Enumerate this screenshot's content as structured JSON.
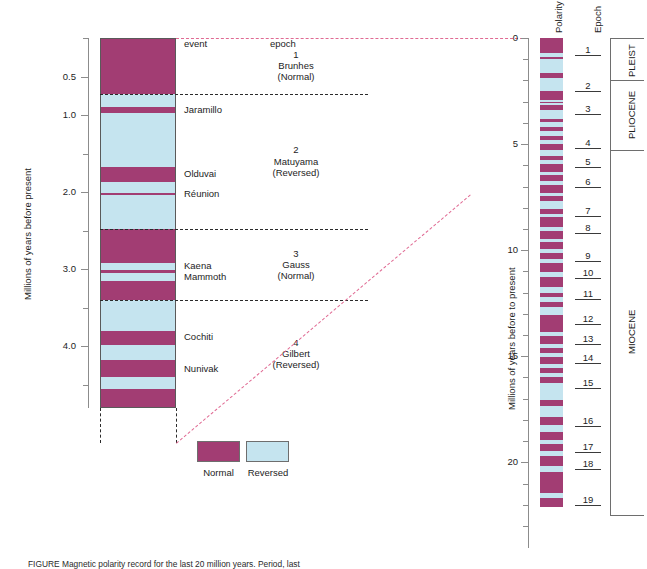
{
  "figure": {
    "caption": "FIGURE   Magnetic polarity record for the last 20 million years. Period, last",
    "left_axis_label": "Millions of years before present",
    "right_axis_label": "Millions of years before to present",
    "column_headers": {
      "event": "event",
      "epoch": "epoch",
      "polarity": "Polarity",
      "epoch_right": "Epoch"
    }
  },
  "colors": {
    "normal": "#a23d73",
    "reversed": "#c5e4ef",
    "correlation": "#e06a93",
    "axis": "#8c8c8c",
    "border": "#5a5a5a",
    "text": "#1d1d1d"
  },
  "legend": {
    "items": [
      {
        "label": "Normal",
        "color": "#a23d73"
      },
      {
        "label": "Reversed",
        "color": "#c5e4ef"
      }
    ]
  },
  "left_axis": {
    "min": 0.0,
    "max": 4.8,
    "major_ticks": [
      0.5,
      1.0,
      2.0,
      3.0,
      4.0
    ],
    "major_tick_labels": [
      "0.5",
      "1.0",
      "2.0",
      "3.0",
      "4.0"
    ],
    "minor_ticks": [
      0.0,
      1.5,
      2.5,
      3.5,
      4.5
    ],
    "unit": "Ma"
  },
  "right_axis": {
    "min": 0,
    "max": 23,
    "major_ticks": [
      0,
      5,
      10,
      15,
      20
    ],
    "major_tick_labels": [
      "0",
      "5",
      "10",
      "15",
      "20"
    ],
    "minor_tick_interval": 1,
    "unit": "Ma"
  },
  "chart_data": {
    "type": "bar",
    "title": "Magnetic polarity record for the last 20 million years",
    "xlabel": "",
    "ylabel": "Millions of years before present",
    "ylim": [
      0,
      4.8
    ],
    "categories": [
      "Normal",
      "Reversed"
    ],
    "values": [
      1,
      0
    ],
    "detail_column": {
      "name": "detailed-polarity-0-4.8Ma",
      "axis_range": [
        0.0,
        4.8
      ],
      "bands": [
        {
          "from": 0.0,
          "to": 0.72,
          "polarity": "Normal"
        },
        {
          "from": 0.72,
          "to": 0.9,
          "polarity": "Reversed"
        },
        {
          "from": 0.9,
          "to": 0.97,
          "polarity": "Normal"
        },
        {
          "from": 0.97,
          "to": 1.67,
          "polarity": "Reversed"
        },
        {
          "from": 1.67,
          "to": 1.87,
          "polarity": "Normal"
        },
        {
          "from": 1.87,
          "to": 2.01,
          "polarity": "Reversed"
        },
        {
          "from": 2.01,
          "to": 2.04,
          "polarity": "Normal"
        },
        {
          "from": 2.04,
          "to": 2.48,
          "polarity": "Reversed"
        },
        {
          "from": 2.48,
          "to": 2.92,
          "polarity": "Normal"
        },
        {
          "from": 2.92,
          "to": 3.01,
          "polarity": "Reversed"
        },
        {
          "from": 3.01,
          "to": 3.05,
          "polarity": "Normal"
        },
        {
          "from": 3.05,
          "to": 3.15,
          "polarity": "Reversed"
        },
        {
          "from": 3.15,
          "to": 3.4,
          "polarity": "Normal"
        },
        {
          "from": 3.4,
          "to": 3.8,
          "polarity": "Reversed"
        },
        {
          "from": 3.8,
          "to": 3.98,
          "polarity": "Normal"
        },
        {
          "from": 3.98,
          "to": 4.18,
          "polarity": "Reversed"
        },
        {
          "from": 4.18,
          "to": 4.4,
          "polarity": "Normal"
        },
        {
          "from": 4.4,
          "to": 4.55,
          "polarity": "Reversed"
        },
        {
          "from": 4.55,
          "to": 4.8,
          "polarity": "Normal"
        }
      ]
    },
    "summary_column": {
      "name": "polarity-0-23Ma",
      "axis_range": [
        0,
        23
      ],
      "bands": [
        {
          "from": 0.0,
          "to": 0.72,
          "polarity": "Normal"
        },
        {
          "from": 0.72,
          "to": 0.9,
          "polarity": "Reversed"
        },
        {
          "from": 0.9,
          "to": 0.97,
          "polarity": "Normal"
        },
        {
          "from": 0.97,
          "to": 1.67,
          "polarity": "Reversed"
        },
        {
          "from": 1.67,
          "to": 1.87,
          "polarity": "Normal"
        },
        {
          "from": 1.87,
          "to": 2.01,
          "polarity": "Reversed"
        },
        {
          "from": 2.01,
          "to": 2.04,
          "polarity": "Normal"
        },
        {
          "from": 2.04,
          "to": 2.48,
          "polarity": "Reversed"
        },
        {
          "from": 2.48,
          "to": 2.92,
          "polarity": "Normal"
        },
        {
          "from": 2.92,
          "to": 3.01,
          "polarity": "Reversed"
        },
        {
          "from": 3.01,
          "to": 3.05,
          "polarity": "Normal"
        },
        {
          "from": 3.05,
          "to": 3.15,
          "polarity": "Reversed"
        },
        {
          "from": 3.15,
          "to": 3.4,
          "polarity": "Normal"
        },
        {
          "from": 3.4,
          "to": 3.8,
          "polarity": "Reversed"
        },
        {
          "from": 3.8,
          "to": 3.98,
          "polarity": "Normal"
        },
        {
          "from": 3.98,
          "to": 4.18,
          "polarity": "Reversed"
        },
        {
          "from": 4.18,
          "to": 4.4,
          "polarity": "Normal"
        },
        {
          "from": 4.4,
          "to": 4.6,
          "polarity": "Reversed"
        },
        {
          "from": 4.6,
          "to": 4.8,
          "polarity": "Normal"
        },
        {
          "from": 4.8,
          "to": 5.0,
          "polarity": "Reversed"
        },
        {
          "from": 5.0,
          "to": 5.3,
          "polarity": "Normal"
        },
        {
          "from": 5.3,
          "to": 5.55,
          "polarity": "Reversed"
        },
        {
          "from": 5.55,
          "to": 5.75,
          "polarity": "Normal"
        },
        {
          "from": 5.75,
          "to": 5.95,
          "polarity": "Reversed"
        },
        {
          "from": 5.95,
          "to": 6.3,
          "polarity": "Normal"
        },
        {
          "from": 6.3,
          "to": 6.45,
          "polarity": "Reversed"
        },
        {
          "from": 6.45,
          "to": 6.75,
          "polarity": "Normal"
        },
        {
          "from": 6.75,
          "to": 6.95,
          "polarity": "Reversed"
        },
        {
          "from": 6.95,
          "to": 7.3,
          "polarity": "Normal"
        },
        {
          "from": 7.3,
          "to": 7.45,
          "polarity": "Reversed"
        },
        {
          "from": 7.45,
          "to": 7.7,
          "polarity": "Normal"
        },
        {
          "from": 7.7,
          "to": 8.05,
          "polarity": "Reversed"
        },
        {
          "from": 8.05,
          "to": 8.3,
          "polarity": "Normal"
        },
        {
          "from": 8.3,
          "to": 8.45,
          "polarity": "Reversed"
        },
        {
          "from": 8.45,
          "to": 8.9,
          "polarity": "Normal"
        },
        {
          "from": 8.9,
          "to": 9.1,
          "polarity": "Reversed"
        },
        {
          "from": 9.1,
          "to": 9.45,
          "polarity": "Normal"
        },
        {
          "from": 9.45,
          "to": 9.6,
          "polarity": "Reversed"
        },
        {
          "from": 9.6,
          "to": 9.95,
          "polarity": "Normal"
        },
        {
          "from": 9.95,
          "to": 10.15,
          "polarity": "Reversed"
        },
        {
          "from": 10.15,
          "to": 10.4,
          "polarity": "Normal"
        },
        {
          "from": 10.4,
          "to": 10.6,
          "polarity": "Reversed"
        },
        {
          "from": 10.6,
          "to": 11.05,
          "polarity": "Normal"
        },
        {
          "from": 11.05,
          "to": 11.25,
          "polarity": "Reversed"
        },
        {
          "from": 11.25,
          "to": 11.75,
          "polarity": "Normal"
        },
        {
          "from": 11.75,
          "to": 12.0,
          "polarity": "Reversed"
        },
        {
          "from": 12.0,
          "to": 12.2,
          "polarity": "Normal"
        },
        {
          "from": 12.2,
          "to": 12.45,
          "polarity": "Reversed"
        },
        {
          "from": 12.45,
          "to": 12.7,
          "polarity": "Normal"
        },
        {
          "from": 12.7,
          "to": 13.05,
          "polarity": "Reversed"
        },
        {
          "from": 13.05,
          "to": 13.85,
          "polarity": "Normal"
        },
        {
          "from": 13.85,
          "to": 14.05,
          "polarity": "Reversed"
        },
        {
          "from": 14.05,
          "to": 14.4,
          "polarity": "Normal"
        },
        {
          "from": 14.4,
          "to": 14.6,
          "polarity": "Reversed"
        },
        {
          "from": 14.6,
          "to": 14.85,
          "polarity": "Normal"
        },
        {
          "from": 14.85,
          "to": 15.05,
          "polarity": "Reversed"
        },
        {
          "from": 15.05,
          "to": 15.35,
          "polarity": "Normal"
        },
        {
          "from": 15.35,
          "to": 15.55,
          "polarity": "Reversed"
        },
        {
          "from": 15.55,
          "to": 15.8,
          "polarity": "Normal"
        },
        {
          "from": 15.8,
          "to": 16.0,
          "polarity": "Reversed"
        },
        {
          "from": 16.0,
          "to": 16.25,
          "polarity": "Normal"
        },
        {
          "from": 16.25,
          "to": 17.05,
          "polarity": "Reversed"
        },
        {
          "from": 17.05,
          "to": 17.35,
          "polarity": "Normal"
        },
        {
          "from": 17.35,
          "to": 17.85,
          "polarity": "Reversed"
        },
        {
          "from": 17.85,
          "to": 18.25,
          "polarity": "Normal"
        },
        {
          "from": 18.25,
          "to": 18.55,
          "polarity": "Reversed"
        },
        {
          "from": 18.55,
          "to": 18.95,
          "polarity": "Normal"
        },
        {
          "from": 18.95,
          "to": 19.15,
          "polarity": "Reversed"
        },
        {
          "from": 19.15,
          "to": 19.45,
          "polarity": "Normal"
        },
        {
          "from": 19.45,
          "to": 19.7,
          "polarity": "Reversed"
        },
        {
          "from": 19.7,
          "to": 20.15,
          "polarity": "Normal"
        },
        {
          "from": 20.15,
          "to": 20.45,
          "polarity": "Reversed"
        },
        {
          "from": 20.45,
          "to": 21.45,
          "polarity": "Normal"
        },
        {
          "from": 21.45,
          "to": 21.7,
          "polarity": "Reversed"
        },
        {
          "from": 21.7,
          "to": 22.1,
          "polarity": "Normal"
        }
      ]
    }
  },
  "events": [
    {
      "name": "Jaramillo",
      "age": 0.93
    },
    {
      "name": "Olduvai",
      "age": 1.77
    },
    {
      "name": "Réunion",
      "age": 2.03
    },
    {
      "name": "Kaena",
      "age": 2.96
    },
    {
      "name": "Mammoth",
      "age": 3.1
    },
    {
      "name": "Cochiti",
      "age": 3.88
    },
    {
      "name": "Nunivak",
      "age": 4.29
    }
  ],
  "magnetic_epochs": [
    {
      "number": "1",
      "name": "Brunhes",
      "polarity": "(Normal)",
      "from": 0.0,
      "to": 0.72
    },
    {
      "number": "2",
      "name": "Matuyama",
      "polarity": "(Reversed)",
      "from": 0.72,
      "to": 2.48
    },
    {
      "number": "3",
      "name": "Gauss",
      "polarity": "(Normal)",
      "from": 2.48,
      "to": 3.4
    },
    {
      "number": "4",
      "name": "Gilbert",
      "polarity": "(Reversed)",
      "from": 3.4,
      "to": 4.8
    }
  ],
  "anomaly_numbers": [
    {
      "label": "1",
      "age": 0.8
    },
    {
      "label": "2",
      "age": 2.5
    },
    {
      "label": "3",
      "age": 3.6
    },
    {
      "label": "4",
      "age": 5.2
    },
    {
      "label": "5",
      "age": 6.1
    },
    {
      "label": "6",
      "age": 7.0
    },
    {
      "label": "7",
      "age": 8.4
    },
    {
      "label": "8",
      "age": 9.2
    },
    {
      "label": "9",
      "age": 10.5
    },
    {
      "label": "10",
      "age": 11.3
    },
    {
      "label": "11",
      "age": 12.3
    },
    {
      "label": "12",
      "age": 13.5
    },
    {
      "label": "13",
      "age": 14.4
    },
    {
      "label": "14",
      "age": 15.3
    },
    {
      "label": "15",
      "age": 16.5
    },
    {
      "label": "16",
      "age": 18.3
    },
    {
      "label": "17",
      "age": 19.5
    },
    {
      "label": "18",
      "age": 20.3
    },
    {
      "label": "19",
      "age": 22.0
    }
  ],
  "geologic_epochs": [
    {
      "name": "PLEIST",
      "from": 0.0,
      "to": 2.0
    },
    {
      "name": "PLIOCENE",
      "from": 2.0,
      "to": 5.3
    },
    {
      "name": "MIOCENE",
      "from": 5.3,
      "to": 22.5
    }
  ]
}
